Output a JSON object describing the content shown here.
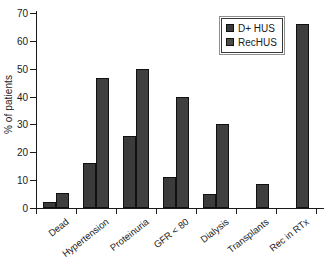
{
  "chart_data": {
    "type": "bar",
    "title": "",
    "xlabel": "",
    "ylabel": "% of patients",
    "ylim": [
      0,
      70
    ],
    "ytick_step": 10,
    "yticks": [
      0,
      10,
      20,
      30,
      40,
      50,
      60,
      70
    ],
    "grid": false,
    "legend_position": "top-right",
    "categories": [
      "Dead",
      "Hypertension",
      "Proteinuria",
      "GFR < 80",
      "Dialysis",
      "Transplants",
      "Rec in RTx"
    ],
    "series": [
      {
        "name": "D+ HUS",
        "color": "#3b3b3b",
        "values": [
          2,
          16,
          26,
          11,
          5,
          0,
          0
        ]
      },
      {
        "name": "RecHUS",
        "color": "#4a4a4a",
        "values": [
          5.5,
          46.5,
          50,
          40,
          30,
          8.5,
          66
        ]
      }
    ]
  },
  "legend": {
    "items": [
      {
        "label": "D+ HUS"
      },
      {
        "label": "RecHUS"
      }
    ]
  },
  "axes": {
    "y_title": "% of patients"
  }
}
